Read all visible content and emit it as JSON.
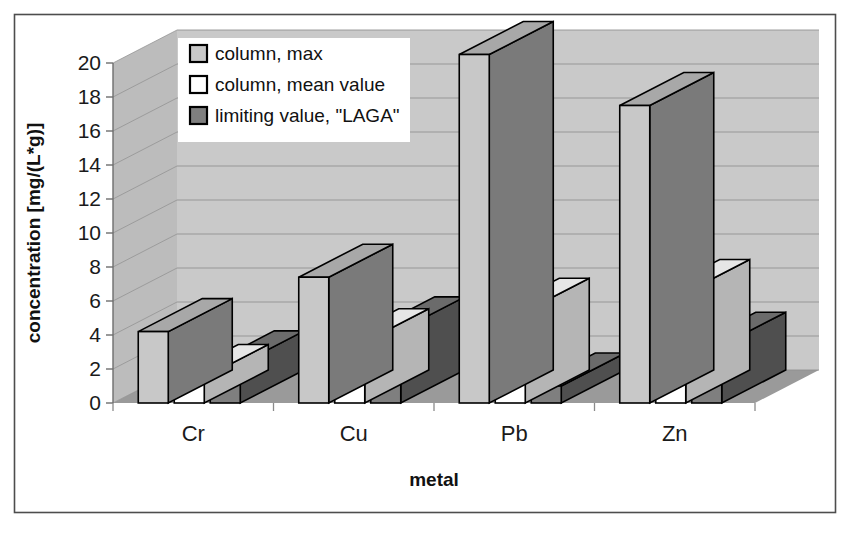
{
  "chart_data": {
    "type": "bar",
    "title": "",
    "subtitle": "",
    "xlabel": "metal",
    "ylabel": "concentration [mg/(L*g)]",
    "categories": [
      "Cr",
      "Cu",
      "Pb",
      "Zn"
    ],
    "ylim": [
      0,
      20
    ],
    "ytick_step": 2,
    "ytick_labels": [
      "0",
      "2",
      "4",
      "6",
      "8",
      "10",
      "12",
      "14",
      "16",
      "18",
      "20"
    ],
    "grid": true,
    "grid_axis": "y",
    "legend_position": "inside-top-left",
    "three_d": true,
    "series": [
      {
        "name": "column, max",
        "color": "#c8c8c8",
        "values": [
          4.2,
          7.4,
          20.5,
          17.5
        ]
      },
      {
        "name": "column, mean value",
        "color": "#ffffff",
        "values": [
          1.5,
          3.6,
          5.4,
          6.5
        ]
      },
      {
        "name": "limiting value, \"LAGA\"",
        "color": "#7f7f7f",
        "values": [
          2.3,
          4.3,
          1.0,
          3.4
        ]
      }
    ],
    "annotations": []
  },
  "legend": {
    "items": [
      {
        "label": "column, max",
        "swatch": "legend-swatch-light-gray"
      },
      {
        "label": "column, mean value",
        "swatch": "legend-swatch-white"
      },
      {
        "label": "limiting value, \"LAGA\"",
        "swatch": "legend-swatch-dark-gray"
      }
    ]
  },
  "axes": {
    "y_title": "concentration [mg/(L*g)]",
    "x_title": "metal",
    "y_ticks": [
      "20",
      "18",
      "16",
      "14",
      "12",
      "10",
      "8",
      "6",
      "4",
      "2",
      "0"
    ],
    "x_ticks": [
      "Cr",
      "Cu",
      "Pb",
      "Zn"
    ]
  },
  "colors": {
    "plot_back_wall": "#c9c9c9",
    "plot_side_wall": "#bcbcbc",
    "plot_floor": "#9a9a9a",
    "floor_top": "#b0b0b0",
    "gridline": "#8f8f8f",
    "border": "#4d4d4d",
    "series_max_front": "#c8c8c8",
    "series_max_side": "#7a7a7a",
    "series_max_top": "#a8a8a8",
    "series_mean_front": "#ffffff",
    "series_mean_side": "#b5b5b5",
    "series_mean_top": "#e6e6e6",
    "series_laga_front": "#7f7f7f",
    "series_laga_side": "#4f4f4f",
    "series_laga_top": "#6b6b6b",
    "outline": "#000000",
    "text": "#111111",
    "page_background": "#ffffff"
  }
}
